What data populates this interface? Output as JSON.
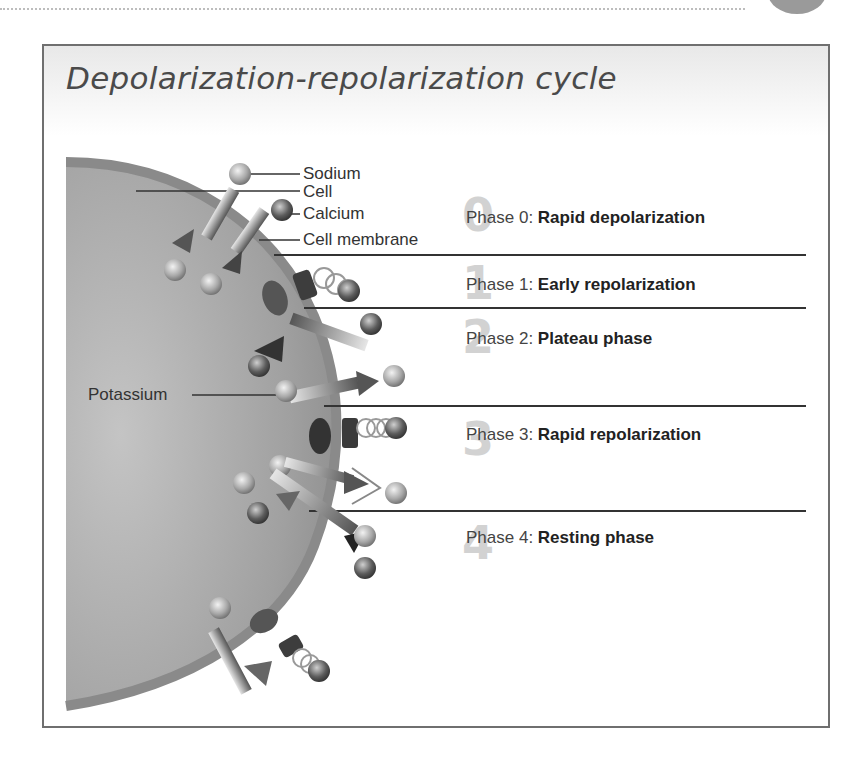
{
  "title": "Depolarization-repolarization cycle",
  "labels": {
    "sodium": "Sodium",
    "cell": "Cell",
    "calcium": "Calcium",
    "cell_membrane": "Cell membrane",
    "potassium": "Potassium"
  },
  "phases": [
    {
      "prefix": "Phase 0:",
      "name": "Rapid depolarization",
      "numeral": "0"
    },
    {
      "prefix": "Phase 1:",
      "name": "Early repolarization",
      "numeral": "1"
    },
    {
      "prefix": "Phase 2:",
      "name": "Plateau phase",
      "numeral": "2"
    },
    {
      "prefix": "Phase 3:",
      "name": "Rapid repolarization",
      "numeral": "3"
    },
    {
      "prefix": "Phase 4:",
      "name": "Resting phase",
      "numeral": "4"
    }
  ],
  "colors": {
    "cell_fill": "#9a9a9a",
    "membrane": "#8c8c8c",
    "frame_border": "#6f6f6f",
    "divider": "#333333",
    "numeral": "#d2d2d2"
  }
}
